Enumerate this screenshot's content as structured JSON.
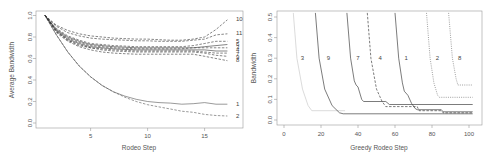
{
  "chart_data": [
    {
      "type": "line",
      "title": "",
      "xlabel": "Rodeo Step",
      "ylabel": "Average Bandwidth",
      "xlim": [
        0.3,
        18.2
      ],
      "ylim": [
        0.0,
        1.0
      ],
      "xticks": [
        5,
        10,
        15
      ],
      "yticks": [
        "0.0",
        "0.2",
        "0.4",
        "0.6",
        "0.8",
        "1.0"
      ],
      "grid": false,
      "legend": "line-end labels on right",
      "x": [
        1,
        2,
        3,
        4,
        5,
        6,
        7,
        8,
        9,
        10,
        11,
        12,
        13,
        14,
        15,
        16,
        17
      ],
      "series": [
        {
          "name": "1",
          "style": "solid",
          "values": [
            1.0,
            0.82,
            0.66,
            0.53,
            0.43,
            0.35,
            0.29,
            0.25,
            0.22,
            0.2,
            0.19,
            0.185,
            0.175,
            0.18,
            0.19,
            0.175,
            0.175
          ]
        },
        {
          "name": "2",
          "style": "dashed",
          "values": [
            1.0,
            0.82,
            0.66,
            0.53,
            0.43,
            0.35,
            0.29,
            0.24,
            0.2,
            0.17,
            0.15,
            0.13,
            0.11,
            0.1,
            0.08,
            0.07,
            0.065
          ]
        },
        {
          "name": "10",
          "style": "dashed",
          "values": [
            1.0,
            0.91,
            0.86,
            0.83,
            0.81,
            0.8,
            0.79,
            0.785,
            0.78,
            0.78,
            0.775,
            0.77,
            0.77,
            0.78,
            0.8,
            0.87,
            0.96
          ]
        },
        {
          "name": "11",
          "style": "dashed",
          "values": [
            1.0,
            0.9,
            0.84,
            0.81,
            0.79,
            0.78,
            0.775,
            0.77,
            0.765,
            0.765,
            0.76,
            0.76,
            0.76,
            0.77,
            0.78,
            0.82,
            0.83
          ]
        },
        {
          "name": "5",
          "style": "dashed",
          "values": [
            1.0,
            0.88,
            0.81,
            0.77,
            0.74,
            0.73,
            0.72,
            0.715,
            0.71,
            0.71,
            0.71,
            0.71,
            0.71,
            0.72,
            0.74,
            0.76,
            0.76
          ]
        },
        {
          "name": "6",
          "style": "solid",
          "values": [
            1.0,
            0.87,
            0.8,
            0.76,
            0.73,
            0.72,
            0.71,
            0.705,
            0.7,
            0.7,
            0.7,
            0.7,
            0.7,
            0.7,
            0.71,
            0.72,
            0.73
          ]
        },
        {
          "name": "3",
          "style": "dashed",
          "values": [
            1.0,
            0.86,
            0.79,
            0.75,
            0.72,
            0.71,
            0.7,
            0.695,
            0.69,
            0.69,
            0.69,
            0.69,
            0.69,
            0.7,
            0.7,
            0.7,
            0.7
          ]
        },
        {
          "name": "4",
          "style": "solid",
          "values": [
            1.0,
            0.86,
            0.78,
            0.74,
            0.71,
            0.7,
            0.69,
            0.685,
            0.68,
            0.68,
            0.68,
            0.68,
            0.68,
            0.68,
            0.68,
            0.67,
            0.67
          ]
        },
        {
          "name": "7",
          "style": "dashed",
          "values": [
            1.0,
            0.85,
            0.77,
            0.73,
            0.7,
            0.69,
            0.68,
            0.675,
            0.67,
            0.67,
            0.67,
            0.67,
            0.67,
            0.67,
            0.66,
            0.65,
            0.65
          ]
        },
        {
          "name": "9",
          "style": "dashed",
          "values": [
            1.0,
            0.85,
            0.77,
            0.72,
            0.7,
            0.68,
            0.67,
            0.665,
            0.66,
            0.66,
            0.66,
            0.66,
            0.66,
            0.66,
            0.65,
            0.63,
            0.62
          ]
        },
        {
          "name": "8",
          "style": "dashed",
          "values": [
            1.0,
            0.84,
            0.76,
            0.71,
            0.68,
            0.66,
            0.65,
            0.645,
            0.64,
            0.64,
            0.64,
            0.64,
            0.64,
            0.64,
            0.62,
            0.6,
            0.58
          ]
        }
      ],
      "end_labels": [
        "10",
        "11",
        "5",
        "6",
        "3",
        "4",
        "7",
        "9",
        "8",
        "1",
        "2"
      ]
    },
    {
      "type": "line",
      "title": "",
      "xlabel": "Greedy Rodeo Step",
      "ylabel": "Bandwidth",
      "xlim": [
        -4,
        106
      ],
      "ylim": [
        0.0,
        0.5
      ],
      "xticks": [
        "0",
        "20",
        "40",
        "60",
        "80",
        "100"
      ],
      "yticks": [
        "0.0",
        "0.1",
        "0.2",
        "0.3",
        "0.4",
        "0.5"
      ],
      "grid": false,
      "legend": "inline labels near y=0.3",
      "series": [
        {
          "name": "3",
          "style": "solid-light",
          "points": [
            [
              5,
              0.52
            ],
            [
              7,
              0.3
            ],
            [
              10,
              0.15
            ],
            [
              13,
              0.07
            ],
            [
              15,
              0.045
            ],
            [
              33,
              0.045
            ]
          ]
        },
        {
          "name": "9",
          "style": "solid",
          "points": [
            [
              17,
              0.52
            ],
            [
              19,
              0.3
            ],
            [
              22,
              0.15
            ],
            [
              26,
              0.07
            ],
            [
              30,
              0.035
            ],
            [
              32,
              0.03
            ],
            [
              102,
              0.03
            ]
          ]
        },
        {
          "name": "7",
          "style": "solid",
          "points": [
            [
              34,
              0.52
            ],
            [
              36,
              0.3
            ],
            [
              38,
              0.19
            ],
            [
              39,
              0.17
            ],
            [
              40,
              0.16
            ],
            [
              42,
              0.1
            ],
            [
              43,
              0.09
            ],
            [
              55,
              0.09
            ],
            [
              57,
              0.075
            ],
            [
              102,
              0.075
            ]
          ]
        },
        {
          "name": "4",
          "style": "dashed",
          "points": [
            [
              45,
              0.52
            ],
            [
              47,
              0.3
            ],
            [
              50,
              0.15
            ],
            [
              53,
              0.09
            ],
            [
              55,
              0.065
            ],
            [
              72,
              0.065
            ],
            [
              73,
              0.045
            ],
            [
              85,
              0.045
            ],
            [
              86,
              0.035
            ],
            [
              102,
              0.035
            ]
          ]
        },
        {
          "name": "1",
          "style": "solid",
          "points": [
            [
              60,
              0.52
            ],
            [
              62,
              0.3
            ],
            [
              64,
              0.18
            ],
            [
              65,
              0.14
            ],
            [
              67,
              0.12
            ],
            [
              69,
              0.08
            ],
            [
              71,
              0.055
            ],
            [
              72,
              0.05
            ],
            [
              85,
              0.05
            ],
            [
              86,
              0.04
            ],
            [
              102,
              0.04
            ]
          ]
        },
        {
          "name": "2",
          "style": "dotted",
          "points": [
            [
              77,
              0.52
            ],
            [
              79,
              0.3
            ],
            [
              81,
              0.18
            ],
            [
              83,
              0.12
            ],
            [
              84,
              0.11
            ],
            [
              102,
              0.11
            ]
          ]
        },
        {
          "name": "8",
          "style": "dotted",
          "points": [
            [
              89,
              0.52
            ],
            [
              91,
              0.3
            ],
            [
              93,
              0.2
            ],
            [
              94,
              0.17
            ],
            [
              102,
              0.17
            ]
          ]
        }
      ],
      "inline_labels": [
        {
          "text": "3",
          "x": 8,
          "y": 0.3
        },
        {
          "text": "9",
          "x": 22,
          "y": 0.3
        },
        {
          "text": "7",
          "x": 38,
          "y": 0.3
        },
        {
          "text": "4",
          "x": 50,
          "y": 0.3
        },
        {
          "text": "1",
          "x": 64,
          "y": 0.3
        },
        {
          "text": "2",
          "x": 81,
          "y": 0.3
        },
        {
          "text": "8",
          "x": 93,
          "y": 0.3
        }
      ]
    }
  ]
}
